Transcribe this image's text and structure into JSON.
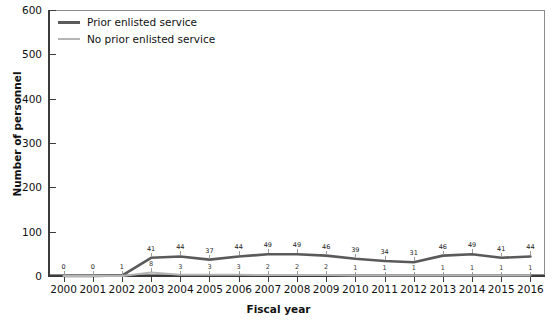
{
  "chart_data": {
    "type": "line",
    "title": "",
    "xlabel": "Fiscal year",
    "ylabel": "Number of personnel",
    "categories": [
      "2000",
      "2001",
      "2002",
      "2003",
      "2004",
      "2005",
      "2006",
      "2007",
      "2008",
      "2009",
      "2010",
      "2011",
      "2012",
      "2013",
      "2014",
      "2015",
      "2016"
    ],
    "ylim": [
      0,
      600
    ],
    "yticks": [
      "0",
      "100",
      "200",
      "300",
      "400",
      "500",
      "600"
    ],
    "grid": false,
    "legend_position": "top-left inside plot",
    "series": [
      {
        "name": "Prior enlisted service",
        "color": "#5a5a5a",
        "values": [
          0,
          0,
          1,
          41,
          44,
          37,
          44,
          49,
          49,
          46,
          39,
          34,
          31,
          46,
          49,
          41,
          44
        ],
        "labels": [
          "0",
          "0",
          "1",
          "41",
          "44",
          "37",
          "44",
          "49",
          "49",
          "46",
          "39",
          "34",
          "31",
          "46",
          "49",
          "41",
          "44"
        ]
      },
      {
        "name": "No prior enlisted service",
        "color": "#b5b5b5",
        "values": [
          0,
          0,
          0,
          8,
          3,
          3,
          3,
          2,
          2,
          2,
          1,
          1,
          1,
          1,
          1,
          1,
          1
        ],
        "labels": [
          "",
          "",
          "",
          "8",
          "3",
          "3",
          "3",
          "2",
          "2",
          "2",
          "1",
          "1",
          "1",
          "1",
          "1",
          "1",
          "1"
        ]
      }
    ]
  },
  "legend": {
    "items": [
      {
        "label": "Prior enlisted service"
      },
      {
        "label": "No prior enlisted service"
      }
    ]
  },
  "axes": {
    "y_title": "Number of personnel",
    "x_title": "Fiscal year"
  },
  "colors": {
    "series_prior": "#5a5a5a",
    "series_no_prior": "#b5b5b5",
    "axis": "#3b3b3b",
    "frame": "#8c8c8c",
    "text": "#111111",
    "background": "#ffffff"
  }
}
